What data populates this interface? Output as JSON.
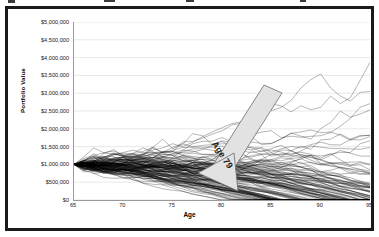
{
  "figure": {
    "frame_border_color": "#1a1a1a",
    "background_color": "#ffffff"
  },
  "annotation": {
    "label": "Age 79",
    "arrow_fill": "#e2e2e2",
    "arrow_stroke": "#6a6a6a",
    "points_to_age": 79
  },
  "chart_data": {
    "type": "line",
    "title": "",
    "subtitle": "",
    "xlabel": "Age",
    "ylabel": "Portfolio Value",
    "xlim": [
      65,
      95
    ],
    "ylim": [
      0,
      5000000
    ],
    "xticks": [
      65,
      70,
      75,
      80,
      85,
      90,
      95
    ],
    "xtick_labels": [
      "65",
      "70",
      "75",
      "80",
      "85",
      "90",
      "95"
    ],
    "yticks": [
      0,
      500000,
      1000000,
      1500000,
      2000000,
      2500000,
      3000000,
      3500000,
      4000000,
      4500000,
      5000000
    ],
    "ytick_labels": [
      "$0",
      "$500,000",
      "$1,000,000",
      "$1,500,000",
      "$2,000,000",
      "$2,500,000",
      "$3,000,000",
      "$3,500,000",
      "$4,000,000",
      "$4,500,000",
      "$5,000,000"
    ],
    "grid": true,
    "grid_axis": "y",
    "grid_color": "#d9d9d9",
    "legend": false,
    "legend_position": "none",
    "line_color": "#000000",
    "line_width": 0.4,
    "series_count": 120,
    "start_age": 65,
    "start_value": 1000000,
    "end_age": 95,
    "envelope": {
      "x": [
        65,
        70,
        75,
        80,
        85,
        90,
        95
      ],
      "max": [
        1000000,
        1320000,
        1620000,
        1850000,
        1720000,
        1700000,
        1480000
      ],
      "median": [
        1000000,
        1050000,
        1020000,
        930000,
        760000,
        560000,
        330000
      ],
      "min": [
        1000000,
        800000,
        590000,
        330000,
        60000,
        0,
        0
      ]
    },
    "series": [
      {
        "name": "path-high",
        "values": [
          1000000,
          1290000,
          1560000,
          1830000,
          1690000,
          1660000,
          1450000
        ]
      },
      {
        "name": "path-upper",
        "values": [
          1000000,
          1180000,
          1370000,
          1520000,
          1430000,
          1300000,
          1020000
        ]
      },
      {
        "name": "path-median",
        "values": [
          1000000,
          1050000,
          1020000,
          930000,
          760000,
          560000,
          330000
        ]
      },
      {
        "name": "path-lower",
        "values": [
          1000000,
          930000,
          820000,
          640000,
          420000,
          210000,
          40000
        ]
      },
      {
        "name": "path-low",
        "values": [
          1000000,
          820000,
          600000,
          340000,
          70000,
          0,
          0
        ]
      }
    ]
  }
}
